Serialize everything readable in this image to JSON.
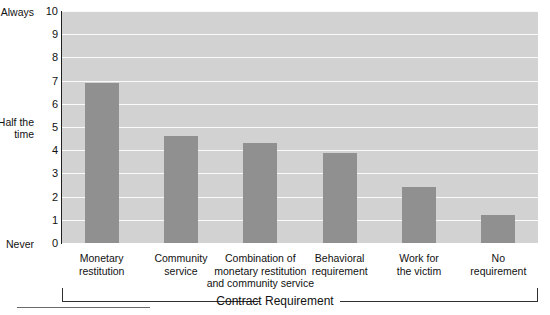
{
  "chart_data": {
    "type": "bar",
    "title": "",
    "xlabel": "Contract Requirement",
    "ylabel": "",
    "ylim": [
      0,
      10
    ],
    "grid": true,
    "legend": null,
    "categories": [
      "Monetary restitution",
      "Community service",
      "Combination of monetary restitution and community service",
      "Behavioral requirement",
      "Work for the victim",
      "No requirement"
    ],
    "category_lines": [
      [
        "Monetary",
        "restitution"
      ],
      [
        "Community",
        "service"
      ],
      [
        "Combination of",
        "monetary restitution",
        "and community service"
      ],
      [
        "Behavioral",
        "requirement"
      ],
      [
        "Work for",
        "the victim"
      ],
      [
        "No",
        "requirement"
      ]
    ],
    "values": [
      6.9,
      4.6,
      4.3,
      3.9,
      2.4,
      1.2
    ],
    "y_ticks": [
      0,
      1,
      2,
      3,
      4,
      5,
      6,
      7,
      8,
      9,
      10
    ],
    "y_tick_labels": [
      "0",
      "1",
      "2",
      "3",
      "4",
      "5",
      "6",
      "7",
      "8",
      "9",
      "10"
    ],
    "y_anchor_labels": [
      {
        "value": 10,
        "text": "Always"
      },
      {
        "value": 5,
        "text": "Half the\ntime"
      },
      {
        "value": 0,
        "text": "Never"
      }
    ],
    "colors": {
      "bar": "#909090",
      "plot_background": "#d2d2d2",
      "gridline": "#fafafa",
      "axis": "#202020",
      "text": "#111111"
    }
  },
  "axis_words": {
    "always": "Always",
    "half_the_time_line1": "Half the",
    "half_the_time_line2": "time",
    "never": "Never"
  },
  "bracket": {
    "label": "Contract Requirement"
  }
}
